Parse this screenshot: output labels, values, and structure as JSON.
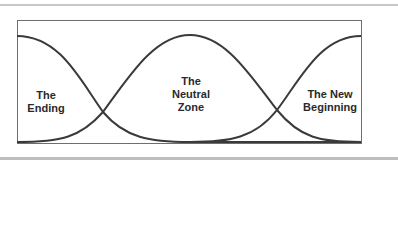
{
  "diagram": {
    "title": "",
    "phases": [
      {
        "id": "ending",
        "lines": [
          "The",
          "Ending"
        ]
      },
      {
        "id": "neutral-zone",
        "lines": [
          "The",
          "Neutral",
          "Zone"
        ]
      },
      {
        "id": "new-beginning",
        "lines": [
          "The New",
          "Beginning"
        ]
      }
    ],
    "colors": {
      "curve": "#3a3a3a",
      "frame": "#6e6e6e",
      "rule": "#c8c8c8",
      "text": "#2a2a2a"
    }
  }
}
